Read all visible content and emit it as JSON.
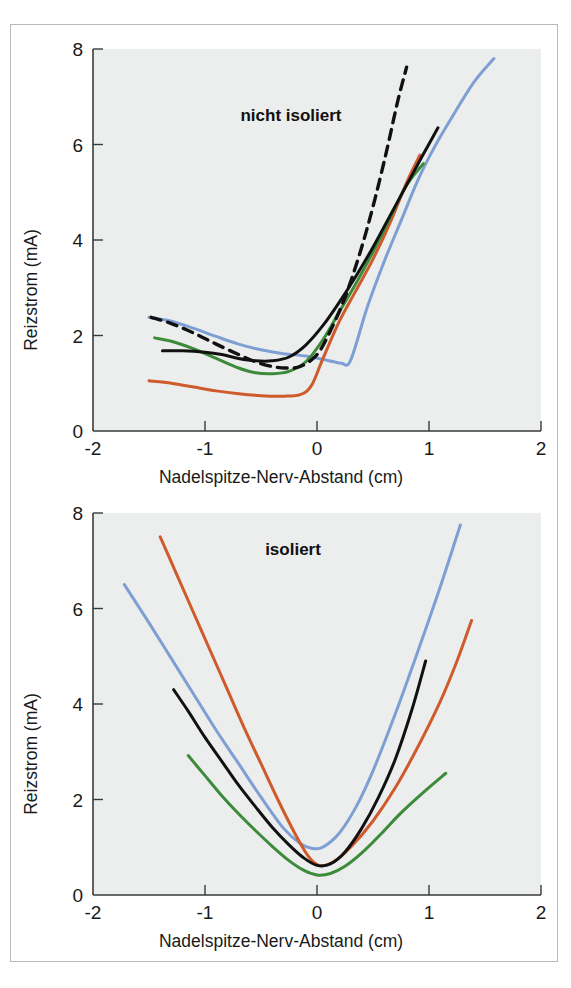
{
  "figure": {
    "background_color": "#ffffff",
    "frame_color": "#b9b9b9",
    "plot_background_color": "#eceeed"
  },
  "axis_titles": {
    "x": "Nadelspitze-Nerv-Abstand (cm)",
    "y": "Reizstrom (mA)"
  },
  "ticks": {
    "x": [
      "-2",
      "-1",
      "0",
      "1",
      "2"
    ],
    "y": [
      "0",
      "2",
      "4",
      "6",
      "8"
    ]
  },
  "colors": {
    "blue": "#7d9fd3",
    "orange": "#cf5a2c",
    "green": "#3c8b3a",
    "black": "#111111",
    "dashed": "#111111",
    "axis": "#3a3a3a",
    "text": "#1a1a1a"
  },
  "chart_data": [
    {
      "id": "nicht-isoliert",
      "type": "line",
      "title": "nicht isoliert",
      "xlabel": "Nadelspitze-Nerv-Abstand (cm)",
      "ylabel": "Reizstrom (mA)",
      "xlim": [
        -2,
        2
      ],
      "ylim": [
        0,
        8
      ],
      "xticks": [
        -2,
        -1,
        0,
        1,
        2
      ],
      "yticks": [
        0,
        2,
        4,
        6,
        8
      ],
      "grid": false,
      "legend": "none",
      "series": [
        {
          "name": "blau",
          "color": "#7d9fd3",
          "style": "solid",
          "x": [
            -1.5,
            -1.3,
            -1.1,
            -0.9,
            -0.7,
            -0.5,
            -0.3,
            -0.1,
            0.05,
            0.15,
            0.22,
            0.3,
            0.45,
            0.6,
            0.75,
            0.9,
            1.05,
            1.2,
            1.4,
            1.58
          ],
          "y": [
            2.38,
            2.3,
            2.15,
            1.98,
            1.82,
            1.7,
            1.62,
            1.57,
            1.5,
            1.45,
            1.42,
            1.48,
            2.6,
            3.55,
            4.4,
            5.25,
            5.95,
            6.55,
            7.3,
            7.8
          ]
        },
        {
          "name": "orange",
          "color": "#cf5a2c",
          "style": "solid",
          "x": [
            -1.5,
            -1.3,
            -1.1,
            -0.9,
            -0.7,
            -0.5,
            -0.3,
            -0.15,
            -0.05,
            0.05,
            0.2,
            0.35,
            0.5,
            0.65,
            0.8,
            0.92
          ],
          "y": [
            1.05,
            1.0,
            0.92,
            0.84,
            0.78,
            0.74,
            0.73,
            0.76,
            0.95,
            1.5,
            2.3,
            2.95,
            3.6,
            4.35,
            5.2,
            5.78
          ]
        },
        {
          "name": "gruen",
          "color": "#3c8b3a",
          "style": "solid",
          "x": [
            -1.45,
            -1.3,
            -1.1,
            -0.9,
            -0.7,
            -0.55,
            -0.4,
            -0.25,
            -0.1,
            0.05,
            0.2,
            0.35,
            0.5,
            0.65,
            0.8,
            0.95
          ],
          "y": [
            1.95,
            1.88,
            1.72,
            1.52,
            1.32,
            1.22,
            1.2,
            1.25,
            1.45,
            1.9,
            2.5,
            3.1,
            3.75,
            4.45,
            5.15,
            5.6
          ]
        },
        {
          "name": "schwarz",
          "color": "#111111",
          "style": "solid",
          "x": [
            -1.38,
            -1.2,
            -1.0,
            -0.85,
            -0.7,
            -0.55,
            -0.4,
            -0.25,
            -0.1,
            0.05,
            0.2,
            0.35,
            0.5,
            0.65,
            0.8,
            0.95,
            1.08
          ],
          "y": [
            1.68,
            1.68,
            1.65,
            1.6,
            1.52,
            1.47,
            1.47,
            1.55,
            1.8,
            2.2,
            2.7,
            3.25,
            3.85,
            4.5,
            5.15,
            5.8,
            6.35
          ]
        },
        {
          "name": "gestrichelt",
          "color": "#111111",
          "style": "dashed",
          "x": [
            -1.48,
            -1.3,
            -1.1,
            -0.9,
            -0.7,
            -0.55,
            -0.4,
            -0.28,
            -0.15,
            0.0,
            0.12,
            0.25,
            0.38,
            0.5,
            0.62,
            0.72,
            0.8
          ],
          "y": [
            2.38,
            2.25,
            2.05,
            1.82,
            1.6,
            1.45,
            1.35,
            1.32,
            1.35,
            1.6,
            2.1,
            2.8,
            3.7,
            4.7,
            5.85,
            6.9,
            7.62
          ]
        }
      ]
    },
    {
      "id": "isoliert",
      "type": "line",
      "title": "isoliert",
      "xlabel": "Nadelspitze-Nerv-Abstand (cm)",
      "ylabel": "Reizstrom (mA)",
      "xlim": [
        -2,
        2
      ],
      "ylim": [
        0,
        8
      ],
      "xticks": [
        -2,
        -1,
        0,
        1,
        2
      ],
      "yticks": [
        0,
        2,
        4,
        6,
        8
      ],
      "grid": false,
      "legend": "none",
      "series": [
        {
          "name": "blau",
          "color": "#7d9fd3",
          "style": "solid",
          "x": [
            -1.72,
            -1.5,
            -1.3,
            -1.1,
            -0.9,
            -0.7,
            -0.5,
            -0.3,
            -0.15,
            -0.05,
            0.05,
            0.2,
            0.35,
            0.5,
            0.7,
            0.9,
            1.1,
            1.28
          ],
          "y": [
            6.5,
            5.7,
            4.95,
            4.2,
            3.45,
            2.75,
            2.05,
            1.4,
            1.08,
            0.98,
            1.0,
            1.3,
            1.85,
            2.6,
            3.8,
            5.1,
            6.45,
            7.75
          ]
        },
        {
          "name": "orange",
          "color": "#cf5a2c",
          "style": "solid",
          "x": [
            -1.4,
            -1.25,
            -1.1,
            -0.95,
            -0.8,
            -0.65,
            -0.5,
            -0.35,
            -0.2,
            -0.08,
            0.02,
            0.15,
            0.3,
            0.5,
            0.7,
            0.9,
            1.1,
            1.25,
            1.38
          ],
          "y": [
            7.5,
            6.7,
            5.9,
            5.1,
            4.3,
            3.5,
            2.75,
            2.0,
            1.3,
            0.82,
            0.62,
            0.7,
            1.0,
            1.55,
            2.25,
            3.1,
            4.05,
            4.9,
            5.75
          ]
        },
        {
          "name": "schwarz",
          "color": "#111111",
          "style": "solid",
          "x": [
            -1.28,
            -1.15,
            -1.0,
            -0.85,
            -0.7,
            -0.55,
            -0.4,
            -0.25,
            -0.12,
            0.0,
            0.12,
            0.25,
            0.4,
            0.55,
            0.7,
            0.85,
            0.97
          ],
          "y": [
            4.3,
            3.85,
            3.3,
            2.8,
            2.3,
            1.85,
            1.42,
            1.05,
            0.78,
            0.62,
            0.65,
            0.9,
            1.4,
            2.05,
            2.85,
            3.9,
            4.9
          ]
        },
        {
          "name": "gruen",
          "color": "#3c8b3a",
          "style": "solid",
          "x": [
            -1.15,
            -1.0,
            -0.85,
            -0.7,
            -0.55,
            -0.4,
            -0.25,
            -0.12,
            0.0,
            0.12,
            0.25,
            0.4,
            0.58,
            0.75,
            0.95,
            1.15
          ],
          "y": [
            2.92,
            2.5,
            2.08,
            1.7,
            1.35,
            1.02,
            0.72,
            0.52,
            0.42,
            0.45,
            0.6,
            0.88,
            1.3,
            1.72,
            2.15,
            2.55
          ]
        }
      ]
    }
  ]
}
